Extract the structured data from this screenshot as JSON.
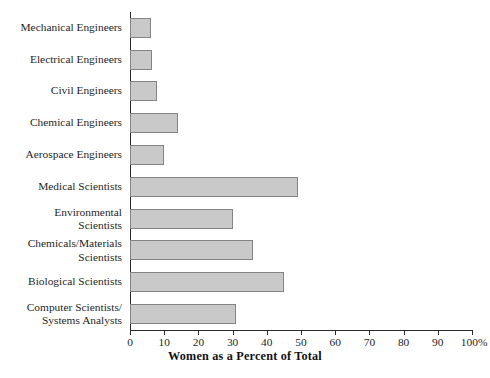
{
  "chart_data": {
    "type": "bar",
    "orientation": "horizontal",
    "title": "",
    "xlabel": "Women as a Percent of Total",
    "ylabel": "",
    "xlim": [
      0,
      100
    ],
    "xticks": [
      0,
      10,
      20,
      30,
      40,
      50,
      60,
      70,
      80,
      90,
      100
    ],
    "xtick_labels": [
      "0",
      "10",
      "20",
      "30",
      "40",
      "50",
      "60",
      "70",
      "80",
      "90",
      "100%"
    ],
    "grid": false,
    "legend": null,
    "bar_fill_color": "#c9c9c9",
    "bar_border_color": "#848484",
    "axis_color": "#2b2b2b",
    "categories": [
      "Mechanical Engineers",
      "Electrical Engineers",
      "Civil Engineers",
      "Chemical Engineers",
      "Aerospace Engineers",
      "Medical Scientists",
      "Environmental\nScientists",
      "Chemicals/Materials\nScientists",
      "Biological Scientists",
      "Computer Scientists/\nSystems Analysts"
    ],
    "values": [
      6,
      6.5,
      8,
      14,
      10,
      49,
      30,
      36,
      45,
      31
    ]
  }
}
